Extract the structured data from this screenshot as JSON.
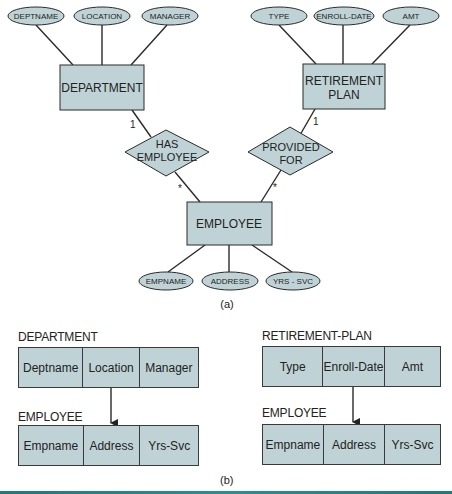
{
  "colors": {
    "entity_fill": "#bfd3d6",
    "attribute_fill": "#bfd3d6",
    "stroke": "#2a2a2a",
    "bar": "#1f7a7a"
  },
  "er_diagram": {
    "caption": "(a)",
    "entities": [
      {
        "id": "department",
        "label": "DEPARTMENT"
      },
      {
        "id": "retirement_plan",
        "label_line1": "RETIREMENT",
        "label_line2": "PLAN"
      },
      {
        "id": "employee",
        "label": "EMPLOYEE"
      }
    ],
    "department_attributes": [
      "DEPTNAME",
      "LOCATION",
      "MANAGER"
    ],
    "retirement_attributes": [
      "TYPE",
      "ENROLL-DATE",
      "AMT"
    ],
    "employee_attributes": [
      "EMPNAME",
      "ADDRESS",
      "YRS - SVC"
    ],
    "relationships": [
      {
        "id": "has_employee",
        "line1": "HAS",
        "line2": "EMPLOYEE",
        "card_one": "1",
        "card_many": "*"
      },
      {
        "id": "provided_for",
        "line1": "PROVIDED",
        "line2": "FOR",
        "card_one": "1",
        "card_many": "*"
      }
    ]
  },
  "relational": {
    "caption": "(b)",
    "left": {
      "parent_title": "DEPARTMENT",
      "parent_cols": [
        "Deptname",
        "Location",
        "Manager"
      ],
      "child_title": "EMPLOYEE",
      "child_cols": [
        "Empname",
        "Address",
        "Yrs-Svc"
      ]
    },
    "right": {
      "parent_title": "RETIREMENT-PLAN",
      "parent_cols": [
        "Type",
        "Enroll-Date",
        "Amt"
      ],
      "child_title": "EMPLOYEE",
      "child_cols": [
        "Empname",
        "Address",
        "Yrs-Svc"
      ]
    }
  }
}
